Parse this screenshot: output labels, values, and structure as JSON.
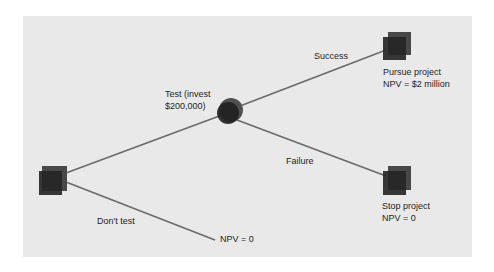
{
  "diagram": {
    "type": "decision-tree",
    "colors": {
      "background": "#e9e9e9",
      "line": "#6a6a6a",
      "node_front": "#2a2a2a",
      "node_back": "#4a4a4a",
      "text": "#1e1e1e"
    },
    "nodes": [
      {
        "id": "decision-root",
        "shape": "square"
      },
      {
        "id": "chance-test",
        "shape": "circle"
      },
      {
        "id": "outcome-pursue",
        "shape": "square",
        "title": "Pursue project",
        "value": "NPV = $2 million"
      },
      {
        "id": "outcome-stop",
        "shape": "square",
        "title": "Stop project",
        "value": "NPV = 0"
      }
    ],
    "branches": {
      "test": {
        "line1": "Test (invest",
        "line2": "$200,000)"
      },
      "success": "Success",
      "failure": "Failure",
      "dont_test": "Don't test"
    },
    "terminal_dont_test": "NPV = 0"
  }
}
